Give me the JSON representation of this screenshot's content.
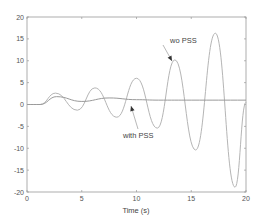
{
  "chart_data": {
    "type": "line",
    "title": "",
    "xlabel": "Time (s)",
    "ylabel": "",
    "xlim": [
      0,
      20
    ],
    "ylim": [
      -20,
      20
    ],
    "grid": false,
    "legend": "none (inline annotations)",
    "x_ticks": [
      0,
      5,
      10,
      15,
      20
    ],
    "y_ticks": [
      -20,
      -15,
      -10,
      -5,
      0,
      5,
      10,
      15,
      20
    ],
    "series": [
      {
        "name": "wo PSS",
        "color": "#b0b0b0",
        "points": [
          [
            0,
            0
          ],
          [
            1.2,
            0
          ],
          [
            2.6,
            2.6
          ],
          [
            4.6,
            -1.3
          ],
          [
            6.2,
            3.8
          ],
          [
            8.2,
            -2.9
          ],
          [
            10.0,
            6.0
          ],
          [
            11.9,
            -5.4
          ],
          [
            13.5,
            10.2
          ],
          [
            15.4,
            -10.4
          ],
          [
            17.2,
            16.3
          ],
          [
            19.0,
            -18.9
          ],
          [
            20.0,
            0.5
          ]
        ]
      },
      {
        "name": "with PSS",
        "color": "#a0a0a0",
        "points": [
          [
            0,
            0
          ],
          [
            1.2,
            0
          ],
          [
            2.7,
            1.8
          ],
          [
            5.0,
            0.7
          ],
          [
            7.5,
            1.5
          ],
          [
            10.0,
            1.1
          ],
          [
            12.0,
            1.0
          ],
          [
            15.0,
            1.0
          ],
          [
            20.0,
            1.0
          ]
        ]
      }
    ],
    "annotations": [
      {
        "text": "wo PSS",
        "arrow_to": [
          13.3,
          10.0
        ]
      },
      {
        "text": "with PSS",
        "arrow_to": [
          9.5,
          1.0
        ]
      }
    ]
  },
  "axis": {
    "x_tick_labels": [
      "0",
      "5",
      "10",
      "15",
      "20"
    ],
    "y_tick_labels": [
      "20",
      "15",
      "10",
      "5",
      "0",
      "-5",
      "-10",
      "-15",
      "-20"
    ],
    "xlabel": "Time (s)"
  },
  "annotations": {
    "wo_pss": "wo PSS",
    "with_pss": "with PSS"
  },
  "colors": {
    "axis": "#999999",
    "wo_pss_line": "#b5b5b5",
    "with_pss_line": "#9a9a9a",
    "arrow": "#333333"
  }
}
